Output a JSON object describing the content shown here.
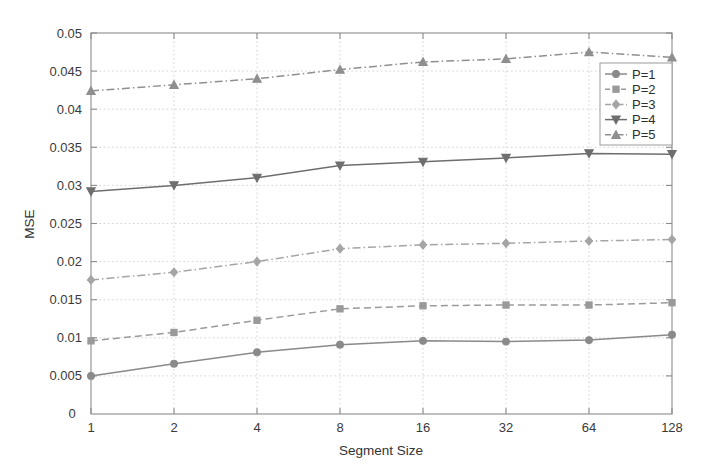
{
  "chart_data": {
    "type": "line",
    "title": "",
    "xlabel": "Segment Size",
    "ylabel": "MSE",
    "x_tick_labels": [
      "1",
      "2",
      "4",
      "8",
      "16",
      "32",
      "64",
      "128"
    ],
    "x_values": [
      1,
      2,
      4,
      8,
      16,
      32,
      64,
      128
    ],
    "x_scale": "log2-even-spacing",
    "origin_label": "0",
    "y_tick_labels": [
      "0.005",
      "0.01",
      "0.015",
      "0.02",
      "0.025",
      "0.03",
      "0.035",
      "0.04",
      "0.045",
      "0.05"
    ],
    "y_ticks": [
      0.005,
      0.01,
      0.015,
      0.02,
      0.025,
      0.03,
      0.035,
      0.04,
      0.045,
      0.05
    ],
    "ylim": [
      0.0,
      0.05
    ],
    "grid": true,
    "legend_position": "upper-right-inside",
    "series": [
      {
        "name": "P=1",
        "values": [
          0.005,
          0.0066,
          0.0081,
          0.0091,
          0.0096,
          0.0095,
          0.0097,
          0.0104
        ],
        "color": "#8a8a8a",
        "dash": "none",
        "marker": "circle"
      },
      {
        "name": "P=2",
        "values": [
          0.0096,
          0.0107,
          0.0123,
          0.0138,
          0.0142,
          0.0143,
          0.0143,
          0.0146
        ],
        "color": "#9a9a9a",
        "dash": "dashed",
        "marker": "square"
      },
      {
        "name": "P=3",
        "values": [
          0.0176,
          0.0186,
          0.02,
          0.0217,
          0.0222,
          0.0224,
          0.0227,
          0.0229
        ],
        "color": "#a5a5a5",
        "dash": "dashdot",
        "marker": "diamond"
      },
      {
        "name": "P=4",
        "values": [
          0.0292,
          0.03,
          0.031,
          0.0326,
          0.0331,
          0.0336,
          0.0342,
          0.0341
        ],
        "color": "#6e6e6e",
        "dash": "none",
        "marker": "triangle-down"
      },
      {
        "name": "P=5",
        "values": [
          0.0424,
          0.0432,
          0.044,
          0.0452,
          0.0462,
          0.0466,
          0.0475,
          0.0468
        ],
        "color": "#8f8f8f",
        "dash": "dashdot",
        "marker": "triangle-up"
      }
    ]
  }
}
